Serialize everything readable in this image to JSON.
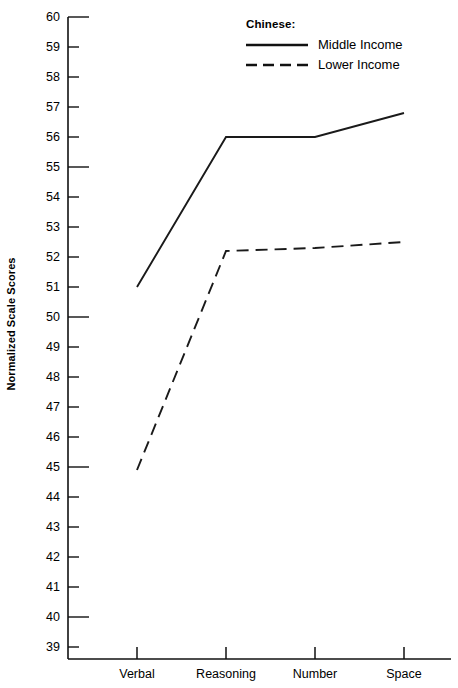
{
  "chart_data": {
    "type": "line",
    "title": "",
    "xlabel": "",
    "ylabel": "Normalized Scale Scores",
    "categories": [
      "Verbal",
      "Reasoning",
      "Number",
      "Space"
    ],
    "ylim": [
      38.6,
      60.0
    ],
    "yticks": [
      39,
      40,
      41,
      42,
      43,
      44,
      45,
      46,
      47,
      48,
      49,
      50,
      51,
      52,
      53,
      54,
      55,
      56,
      57,
      58,
      59,
      60
    ],
    "ymajor_ticks": [
      40,
      45,
      50,
      55,
      60
    ],
    "grid": false,
    "legend_position": "top-right",
    "legend_title": "Chinese:",
    "series": [
      {
        "name": "Middle Income",
        "style": "solid",
        "color": "#1a1a1a",
        "values": [
          51.0,
          56.0,
          56.0,
          56.8
        ]
      },
      {
        "name": "Lower Income",
        "style": "dashed",
        "color": "#1a1a1a",
        "values": [
          44.9,
          52.2,
          52.3,
          52.5
        ]
      }
    ]
  },
  "axis": {
    "y_title": "Normalized Scale Scores",
    "y_labels": [
      "60",
      "59",
      "58",
      "57",
      "56",
      "55",
      "54",
      "53",
      "52",
      "51",
      "50",
      "49",
      "48",
      "47",
      "46",
      "45",
      "44",
      "43",
      "42",
      "41",
      "40",
      "39"
    ],
    "x_labels": [
      "Verbal",
      "Reasoning",
      "Number",
      "Space"
    ]
  },
  "legend": {
    "title": "Chinese:",
    "entries": [
      {
        "label": "Middle Income",
        "style": "solid"
      },
      {
        "label": "Lower Income",
        "style": "dashed"
      }
    ]
  }
}
